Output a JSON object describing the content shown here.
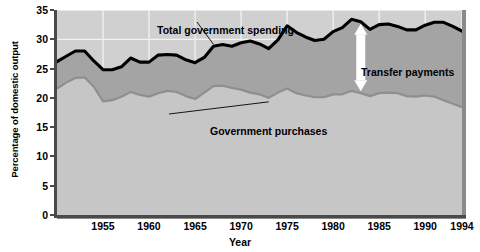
{
  "chart_data": {
    "type": "area",
    "title": "",
    "subtitle": "",
    "xlabel": "Year",
    "ylabel": "Percentage of domestic output",
    "xlim": [
      1950,
      1994
    ],
    "ylim": [
      0,
      35
    ],
    "grid": true,
    "legend_position": "in-plot annotations",
    "stacked": true,
    "xticks": [
      1955,
      1960,
      1965,
      1970,
      1975,
      1980,
      1985,
      1990,
      1994
    ],
    "yticks": [
      0,
      5,
      10,
      15,
      20,
      25,
      30,
      35
    ],
    "x": [
      1950,
      1951,
      1952,
      1953,
      1954,
      1955,
      1956,
      1957,
      1958,
      1959,
      1960,
      1961,
      1962,
      1963,
      1964,
      1965,
      1966,
      1967,
      1968,
      1969,
      1970,
      1971,
      1972,
      1973,
      1974,
      1975,
      1976,
      1977,
      1978,
      1979,
      1980,
      1981,
      1982,
      1983,
      1984,
      1985,
      1986,
      1987,
      1988,
      1989,
      1990,
      1991,
      1992,
      1993,
      1994
    ],
    "series": [
      {
        "name": "Government purchases",
        "color": "#c6c6c6",
        "line_color": "#8f8f8f",
        "values": [
          21.6,
          22.6,
          23.4,
          23.5,
          21.9,
          19.4,
          19.6,
          20.2,
          21.0,
          20.5,
          20.2,
          20.8,
          21.2,
          21.0,
          20.3,
          19.8,
          20.9,
          22.0,
          22.1,
          21.7,
          21.4,
          20.9,
          20.6,
          20.0,
          20.9,
          21.6,
          20.8,
          20.4,
          20.1,
          20.1,
          20.6,
          20.6,
          21.2,
          20.8,
          20.3,
          20.8,
          20.9,
          20.8,
          20.3,
          20.2,
          20.4,
          20.2,
          19.6,
          19.0,
          18.4
        ]
      },
      {
        "name": "Transfer payments",
        "color": "#a4a4a4",
        "line_color": "#a4a4a4",
        "values": [
          4.6,
          4.5,
          4.6,
          4.5,
          4.4,
          5.4,
          5.2,
          5.1,
          5.8,
          5.6,
          5.9,
          6.5,
          6.2,
          6.3,
          6.2,
          6.2,
          6.0,
          6.8,
          7.0,
          7.1,
          8.0,
          8.8,
          8.6,
          8.4,
          9.0,
          10.7,
          10.4,
          10.0,
          9.7,
          9.9,
          10.7,
          11.4,
          12.2,
          12.2,
          11.4,
          11.7,
          11.7,
          11.4,
          11.3,
          11.4,
          12.0,
          12.7,
          13.3,
          13.2,
          13.0
        ]
      }
    ],
    "total_line": {
      "name": "Total government spending",
      "color": "#000000",
      "values": [
        26.2,
        27.1,
        28.0,
        28.0,
        26.3,
        24.8,
        24.8,
        25.3,
        26.8,
        26.1,
        26.1,
        27.3,
        27.4,
        27.3,
        26.5,
        26.0,
        26.9,
        28.8,
        29.1,
        28.8,
        29.4,
        29.7,
        29.2,
        28.4,
        29.9,
        32.3,
        31.2,
        30.4,
        29.8,
        30.0,
        31.3,
        32.0,
        33.4,
        33.0,
        31.7,
        32.5,
        32.6,
        32.2,
        31.6,
        31.6,
        32.4,
        32.9,
        32.9,
        32.2,
        31.4
      ]
    },
    "annotations": [
      {
        "id": "total",
        "text": "Total government spending",
        "kind": "leader-label"
      },
      {
        "id": "transfer",
        "text": "Transfer payments",
        "kind": "region-label"
      },
      {
        "id": "purchases",
        "text": "Government purchases",
        "kind": "leader-label"
      },
      {
        "id": "transfer-arrow",
        "text": "",
        "kind": "double-headed-arrow",
        "color": "#ffffff",
        "year": 1983
      }
    ]
  },
  "axis": {
    "y_title": "Percentage of domestic output",
    "x_title": "Year",
    "y_ticks": [
      "0",
      "5",
      "10",
      "15",
      "20",
      "25",
      "30",
      "35"
    ],
    "x_ticks": [
      "1955",
      "1960",
      "1965",
      "1970",
      "1975",
      "1980",
      "1985",
      "1990",
      "1994"
    ]
  },
  "labels": {
    "total": "Total government spending",
    "transfer": "Transfer payments",
    "purchases": "Government purchases"
  },
  "colors": {
    "purchases_fill": "#c6c6c6",
    "transfer_fill": "#a4a4a4",
    "total_line": "#000000",
    "plot_bg": "#d0d0d0",
    "gridline": "#f2f2f2",
    "arrow": "#ffffff",
    "axis": "#4a4a4a"
  }
}
